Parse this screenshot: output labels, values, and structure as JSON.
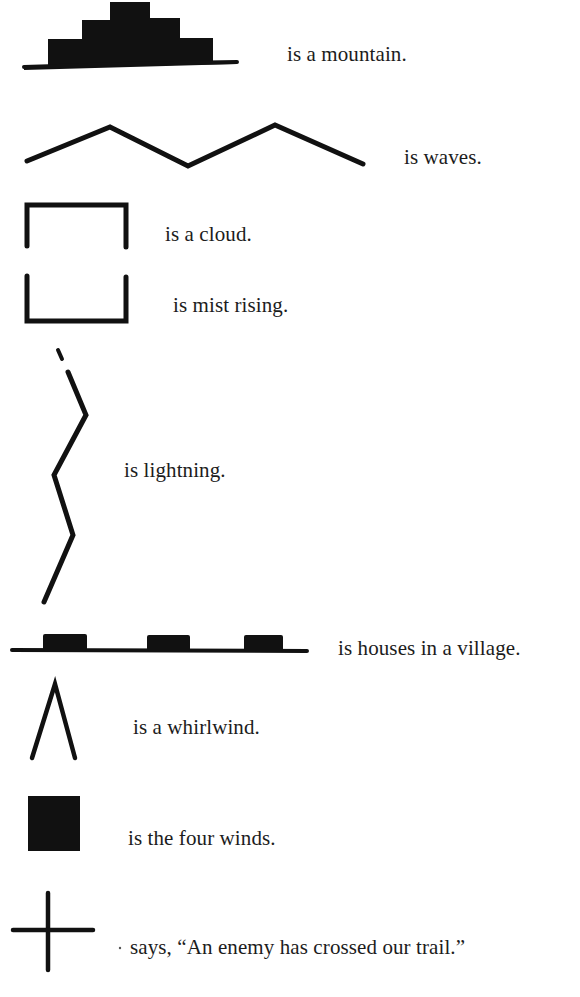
{
  "page": {
    "ink_color": "#111111",
    "background": "#ffffff"
  },
  "legend": [
    {
      "symbol": "mountain-icon",
      "caption": "is a mountain."
    },
    {
      "symbol": "waves-icon",
      "caption": "is waves."
    },
    {
      "symbol": "cloud-icon",
      "caption": "is a cloud."
    },
    {
      "symbol": "mist-rising-icon",
      "caption": "is mist rising."
    },
    {
      "symbol": "lightning-icon",
      "caption": "is lightning."
    },
    {
      "symbol": "village-houses-icon",
      "caption": "is houses in a village."
    },
    {
      "symbol": "whirlwind-icon",
      "caption": "is a whirlwind."
    },
    {
      "symbol": "four-winds-icon",
      "caption": "is the four winds."
    },
    {
      "symbol": "cross-icon",
      "caption": "says, “An enemy has crossed our trail.”"
    }
  ]
}
